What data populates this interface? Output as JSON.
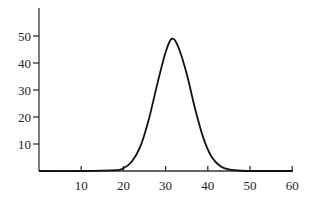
{
  "chart_data": {
    "type": "line",
    "title": "",
    "xlabel": "",
    "ylabel": "",
    "xlim": [
      0,
      60
    ],
    "ylim": [
      0,
      60
    ],
    "x_ticks": [
      10,
      20,
      30,
      40,
      50,
      60
    ],
    "y_ticks": [
      10,
      20,
      30,
      40,
      50
    ],
    "x_tick_labels": [
      "10",
      "20",
      "30",
      "40",
      "50",
      "60"
    ],
    "y_tick_labels": [
      "10",
      "20",
      "30",
      "40",
      "50"
    ],
    "grid": false,
    "legend": null,
    "series": [
      {
        "name": "curve",
        "description": "bell-shaped curve peaking near x≈31.5 at y≈49",
        "x": [
          0,
          10,
          18,
          20,
          22,
          24,
          26,
          28,
          30,
          31.5,
          33,
          35,
          37,
          39,
          41,
          43,
          45,
          48,
          52,
          60
        ],
        "y": [
          0,
          0,
          0.3,
          1,
          3.5,
          9,
          19,
          32,
          44,
          49,
          46,
          36,
          23,
          12,
          5,
          1.8,
          0.6,
          0.1,
          0,
          0
        ]
      }
    ]
  }
}
